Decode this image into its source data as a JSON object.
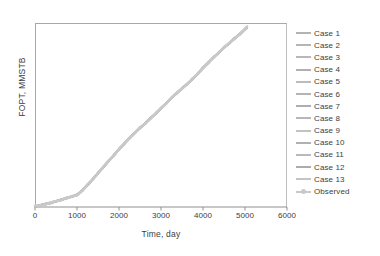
{
  "chart_data": {
    "type": "line",
    "title": "",
    "xlabel": "Time, day",
    "ylabel": "FOPT, MMSTB",
    "xlim": [
      0,
      6000
    ],
    "ylim": [
      0,
      100
    ],
    "xticks": [
      0,
      1000,
      2000,
      3000,
      4000,
      5000,
      6000
    ],
    "xtick_labels": [
      "0",
      "1000",
      "2000",
      "3000",
      "4000",
      "5000",
      "6000"
    ],
    "yticks": [],
    "ytick_labels": [],
    "grid": false,
    "legend_position": "right",
    "note": "All 13 simulation cases overlap with the observed history, drawing as one light-gray S-shaped cumulative production curve.",
    "x": [
      0,
      120,
      250,
      380,
      500,
      630,
      750,
      880,
      1000,
      1130,
      1250,
      1380,
      1500,
      1630,
      1750,
      1880,
      2000,
      2130,
      2250,
      2380,
      2500,
      2630,
      2750,
      2880,
      3000,
      3130,
      3250,
      3380,
      3500,
      3630,
      3750,
      3880,
      4000,
      4130,
      4250,
      4380,
      4500,
      4630,
      4750,
      4880,
      5050
    ],
    "series": [
      {
        "name": "Case 1",
        "color": "#b3b3b3",
        "values": [
          0.3,
          0.9,
          1.6,
          2.3,
          3.1,
          4.0,
          4.8,
          5.7,
          6.6,
          9.0,
          12.0,
          15.2,
          18.4,
          21.7,
          25.0,
          28.2,
          31.4,
          34.5,
          37.5,
          40.3,
          43.0,
          45.6,
          48.2,
          50.9,
          53.7,
          56.5,
          59.3,
          62.0,
          64.5,
          66.9,
          69.6,
          72.6,
          75.6,
          78.5,
          81.3,
          84.0,
          86.6,
          89.1,
          91.6,
          94.0,
          97.8
        ]
      },
      {
        "name": "Case 2",
        "color": "#b5b5b5"
      },
      {
        "name": "Case 3",
        "color": "#b8b8b8"
      },
      {
        "name": "Case 4",
        "color": "#b0b0b0"
      },
      {
        "name": "Case 5",
        "color": "#bcbcbc"
      },
      {
        "name": "Case 6",
        "color": "#b4b4b4"
      },
      {
        "name": "Case 7",
        "color": "#aeaeae"
      },
      {
        "name": "Case 8",
        "color": "#b7b7b7"
      },
      {
        "name": "Case 9",
        "color": "#c2c2c2"
      },
      {
        "name": "Case 10",
        "color": "#b1b1b1"
      },
      {
        "name": "Case 11",
        "color": "#b9b9b9"
      },
      {
        "name": "Case 12",
        "color": "#acacac"
      },
      {
        "name": "Case 13",
        "color": "#c4c4c4"
      },
      {
        "name": "Observed",
        "color": "#c9c9c9"
      }
    ]
  },
  "axes": {
    "y_title": "FOPT, MMSTB",
    "x_title": "Time, day",
    "x_ticks": [
      {
        "label": "0"
      },
      {
        "label": "1000"
      },
      {
        "label": "2000"
      },
      {
        "label": "3000"
      },
      {
        "label": "4000"
      },
      {
        "label": "5000"
      },
      {
        "label": "6000"
      }
    ]
  },
  "legend": {
    "entries": [
      {
        "label": "Case 1",
        "color": "#b3b3b3",
        "marker": "line"
      },
      {
        "label": "Case 2",
        "color": "#b5b5b5",
        "marker": "line"
      },
      {
        "label": "Case 3",
        "color": "#b8b8b8",
        "marker": "line"
      },
      {
        "label": "Case 4",
        "color": "#b0b0b0",
        "marker": "line"
      },
      {
        "label": "Case 5",
        "color": "#bcbcbc",
        "marker": "line"
      },
      {
        "label": "Case 6",
        "color": "#b4b4b4",
        "marker": "line"
      },
      {
        "label": "Case 7",
        "color": "#aeaeae",
        "marker": "line"
      },
      {
        "label": "Case 8",
        "color": "#b7b7b7",
        "marker": "line"
      },
      {
        "label": "Case 9",
        "color": "#c2c2c2",
        "marker": "line"
      },
      {
        "label": "Case 10",
        "color": "#b1b1b1",
        "marker": "line"
      },
      {
        "label": "Case 11",
        "color": "#b9b9b9",
        "marker": "line"
      },
      {
        "label": "Case 12",
        "color": "#acacac",
        "marker": "line"
      },
      {
        "label": "Case 13",
        "color": "#c4c4c4",
        "marker": "line"
      },
      {
        "label": "Observed",
        "color": "#c9c9c9",
        "marker": "line-dot"
      }
    ]
  },
  "style": {
    "frame_color": "#a8a8a8",
    "axis_color": "#8f8f8f",
    "text_color": "#3d3d3d",
    "background": "#ffffff"
  }
}
